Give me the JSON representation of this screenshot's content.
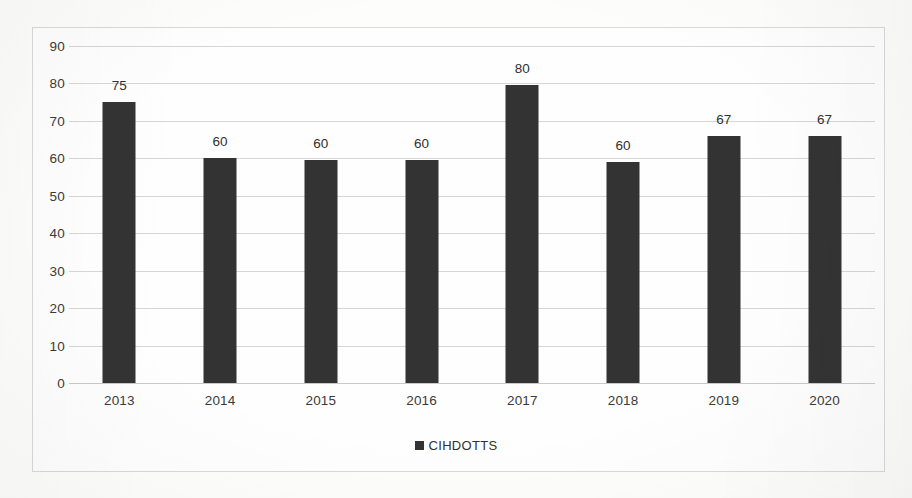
{
  "chart_data": {
    "type": "bar",
    "title": "",
    "subtitle": "",
    "xlabel": "",
    "ylabel": "",
    "categories": [
      "2013",
      "2014",
      "2015",
      "2016",
      "2017",
      "2018",
      "2019",
      "2020"
    ],
    "series": [
      {
        "name": "CIHDOTTS",
        "values": [
          75,
          60,
          60,
          60,
          80,
          60,
          67,
          67
        ],
        "plotted_values": [
          75,
          60,
          59.5,
          59.5,
          79.5,
          59,
          66,
          66
        ],
        "color": "#333333"
      }
    ],
    "data_labels": [
      "75",
      "60",
      "60",
      "60",
      "80",
      "60",
      "67",
      "67"
    ],
    "ylim": [
      0,
      90
    ],
    "ytick_step": 10,
    "ytick_labels": [
      "90",
      "80",
      "70",
      "60",
      "50",
      "40",
      "30",
      "20",
      "10",
      "0"
    ],
    "grid": true,
    "grid_axis": "y",
    "legend": {
      "position": "bottom",
      "entries": [
        {
          "label": "CIHDOTTS",
          "marker": "square",
          "color": "#333333"
        }
      ]
    },
    "axis_line_color": "#c9c9c9",
    "gridline_color": "#d6d6d6",
    "frame_color": "#d9d9d9",
    "background_color": "#fefefe",
    "text_color": "#3a3a3a"
  }
}
